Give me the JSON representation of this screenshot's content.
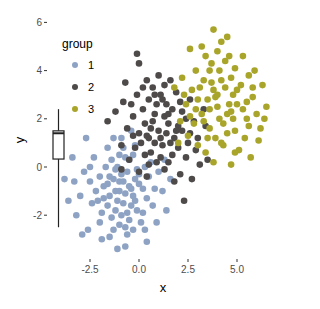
{
  "chart_data": {
    "type": "scatter",
    "title": "",
    "xlabel": "x",
    "ylabel": "y",
    "xlim": [
      -4.6,
      6.8
    ],
    "ylim": [
      -3.8,
      6.3
    ],
    "xticks": [
      -2.5,
      0.0,
      2.5,
      5.0
    ],
    "xtick_labels": [
      "-2.5",
      "0.0",
      "2.5",
      "5.0"
    ],
    "yticks": [
      -2,
      0,
      2,
      4,
      6
    ],
    "ytick_labels": [
      "-2",
      "0",
      "2",
      "4",
      "6"
    ],
    "grid": false,
    "legend": {
      "title": "group",
      "placement": "top-left-inside",
      "entries": [
        "1",
        "2",
        "3"
      ]
    },
    "marginal_boxplot": {
      "axis": "y",
      "whisker_low": -2.5,
      "q1": 0.33,
      "median": 1.4,
      "q3": 1.5,
      "whisker_high": 2.4
    },
    "series": [
      {
        "name": "1",
        "color": "#8EA3C4",
        "points": [
          [
            -1.0,
            -1.0
          ],
          [
            -0.5,
            -0.8
          ],
          [
            -1.3,
            -0.5
          ],
          [
            -0.8,
            -1.5
          ],
          [
            -1.5,
            -1.2
          ],
          [
            -0.2,
            -0.5
          ],
          [
            -1.1,
            0.0
          ],
          [
            -0.6,
            -0.2
          ],
          [
            -1.8,
            -0.8
          ],
          [
            -0.3,
            -1.2
          ],
          [
            -1.2,
            -1.8
          ],
          [
            -0.9,
            -2.0
          ],
          [
            -0.4,
            -1.6
          ],
          [
            -1.6,
            -1.6
          ],
          [
            0.2,
            -0.9
          ],
          [
            0.0,
            -0.3
          ],
          [
            -0.7,
            0.4
          ],
          [
            -1.4,
            0.3
          ],
          [
            -2.0,
            -0.4
          ],
          [
            -2.2,
            -1.0
          ],
          [
            -0.1,
            -1.8
          ],
          [
            0.4,
            -1.3
          ],
          [
            -1.9,
            -1.9
          ],
          [
            -1.0,
            -2.4
          ],
          [
            -0.5,
            -2.2
          ],
          [
            0.5,
            -0.4
          ],
          [
            0.8,
            -0.9
          ],
          [
            -0.3,
            0.5
          ],
          [
            -1.7,
            0.0
          ],
          [
            -2.5,
            -0.6
          ],
          [
            -2.4,
            -1.5
          ],
          [
            -1.3,
            -2.6
          ],
          [
            0.1,
            -2.3
          ],
          [
            -0.8,
            0.8
          ],
          [
            -0.2,
            0.9
          ],
          [
            0.6,
            0.2
          ],
          [
            1.0,
            -0.2
          ],
          [
            -2.8,
            -0.2
          ],
          [
            -3.0,
            -1.2
          ],
          [
            -2.0,
            -2.3
          ],
          [
            -0.6,
            -2.8
          ],
          [
            -1.5,
            -2.9
          ],
          [
            0.3,
            -2.6
          ],
          [
            1.2,
            -1.0
          ],
          [
            -0.9,
            1.2
          ],
          [
            -1.6,
            0.8
          ],
          [
            -2.3,
            0.4
          ],
          [
            -3.3,
            -0.6
          ],
          [
            -3.4,
            0.4
          ],
          [
            -3.8,
            -0.5
          ],
          [
            -3.2,
            -2.0
          ],
          [
            -2.6,
            -2.6
          ],
          [
            -0.7,
            -3.3
          ],
          [
            -1.1,
            -3.4
          ],
          [
            0.4,
            -3.1
          ],
          [
            1.4,
            -1.8
          ],
          [
            1.3,
            0.3
          ],
          [
            -0.4,
            1.5
          ],
          [
            -1.3,
            1.2
          ],
          [
            -2.7,
            1.2
          ],
          [
            -1.0,
            -0.6
          ],
          [
            -0.7,
            -1.1
          ],
          [
            -1.2,
            -1.0
          ],
          [
            -0.4,
            -0.9
          ],
          [
            -0.9,
            -0.3
          ],
          [
            -1.5,
            -0.4
          ],
          [
            -0.6,
            -1.9
          ],
          [
            -1.1,
            -1.4
          ],
          [
            -0.2,
            -1.4
          ],
          [
            -1.8,
            -1.3
          ],
          [
            0.0,
            -0.7
          ],
          [
            -0.8,
            -0.6
          ],
          [
            -1.4,
            -2.1
          ],
          [
            0.7,
            -1.6
          ],
          [
            -2.1,
            -1.4
          ],
          [
            -0.3,
            -2.6
          ],
          [
            -1.0,
            0.5
          ],
          [
            0.3,
            0.0
          ],
          [
            -2.5,
            0.0
          ],
          [
            0.9,
            -2.3
          ],
          [
            -3.6,
            -1.4
          ],
          [
            -2.9,
            -2.8
          ],
          [
            -1.9,
            -3.0
          ],
          [
            1.6,
            -0.5
          ],
          [
            -0.5,
            0.3
          ],
          [
            -1.6,
            -0.7
          ],
          [
            -0.1,
            -0.1
          ],
          [
            -1.2,
            -0.1
          ],
          [
            -0.7,
            -2.5
          ],
          [
            0.2,
            -1.9
          ]
        ]
      },
      {
        "name": "2",
        "color": "#4E4A4A",
        "points": [
          [
            1.0,
            1.5
          ],
          [
            0.5,
            1.2
          ],
          [
            1.5,
            1.8
          ],
          [
            0.8,
            2.2
          ],
          [
            1.2,
            0.9
          ],
          [
            0.3,
            1.8
          ],
          [
            1.8,
            1.2
          ],
          [
            0.6,
            0.6
          ],
          [
            1.4,
            2.6
          ],
          [
            2.0,
            1.7
          ],
          [
            0.0,
            1.4
          ],
          [
            0.2,
            2.4
          ],
          [
            1.1,
            3.0
          ],
          [
            1.7,
            0.5
          ],
          [
            2.2,
            2.3
          ],
          [
            0.9,
            0.2
          ],
          [
            -0.2,
            0.8
          ],
          [
            -0.3,
            2.1
          ],
          [
            0.7,
            3.3
          ],
          [
            2.5,
            1.0
          ],
          [
            1.3,
            -0.1
          ],
          [
            2.4,
            0.4
          ],
          [
            2.8,
            1.9
          ],
          [
            1.9,
            3.1
          ],
          [
            0.4,
            3.6
          ],
          [
            1.0,
            3.8
          ],
          [
            -0.6,
            1.6
          ],
          [
            -0.5,
            0.3
          ],
          [
            2.6,
            2.8
          ],
          [
            3.0,
            1.2
          ],
          [
            2.1,
            -0.3
          ],
          [
            3.1,
            0.1
          ],
          [
            1.6,
            3.6
          ],
          [
            -0.1,
            3.0
          ],
          [
            -0.9,
            0.9
          ],
          [
            -0.8,
            2.7
          ],
          [
            0.0,
            4.3
          ],
          [
            -0.1,
            4.7
          ],
          [
            0.4,
            -0.4
          ],
          [
            3.3,
            2.4
          ],
          [
            2.7,
            -0.5
          ],
          [
            2.3,
            -1.4
          ],
          [
            -1.2,
            2.3
          ],
          [
            1.5,
            0.2
          ],
          [
            0.8,
            1.0
          ],
          [
            1.3,
            2.1
          ],
          [
            0.5,
            2.8
          ],
          [
            2.0,
            0.8
          ],
          [
            1.7,
            2.4
          ],
          [
            0.1,
            1.0
          ],
          [
            1.1,
            1.2
          ],
          [
            0.6,
            1.6
          ],
          [
            1.9,
            1.5
          ],
          [
            0.9,
            2.6
          ],
          [
            1.4,
            1.4
          ],
          [
            0.3,
            0.5
          ],
          [
            2.2,
            1.5
          ],
          [
            1.2,
            2.8
          ],
          [
            0.7,
            1.9
          ],
          [
            1.6,
            1.0
          ],
          [
            -0.4,
            2.6
          ],
          [
            -0.7,
            3.5
          ],
          [
            0.2,
            3.3
          ],
          [
            2.9,
            0.7
          ],
          [
            3.4,
            1.7
          ],
          [
            0.0,
            -0.2
          ],
          [
            -0.9,
            -0.1
          ],
          [
            1.8,
            -0.6
          ],
          [
            -1.6,
            1.9
          ],
          [
            3.5,
            0.3
          ],
          [
            1.1,
            0.4
          ],
          [
            0.4,
            1.3
          ],
          [
            2.4,
            2.0
          ],
          [
            1.3,
            3.4
          ],
          [
            0.8,
            3.0
          ],
          [
            -0.3,
            1.3
          ],
          [
            2.6,
            1.4
          ],
          [
            1.5,
            2.2
          ],
          [
            0.5,
            0.1
          ],
          [
            2.1,
            2.7
          ]
        ]
      },
      {
        "name": "3",
        "color": "#A8A52A",
        "points": [
          [
            4.0,
            2.5
          ],
          [
            3.5,
            2.8
          ],
          [
            4.5,
            2.2
          ],
          [
            3.8,
            3.2
          ],
          [
            4.3,
            1.8
          ],
          [
            3.2,
            2.2
          ],
          [
            4.8,
            3.0
          ],
          [
            3.6,
            1.6
          ],
          [
            4.2,
            3.6
          ],
          [
            5.0,
            2.6
          ],
          [
            3.0,
            2.8
          ],
          [
            3.3,
            3.6
          ],
          [
            4.1,
            4.0
          ],
          [
            4.9,
            1.5
          ],
          [
            5.2,
            3.4
          ],
          [
            3.9,
            1.2
          ],
          [
            2.8,
            1.8
          ],
          [
            2.7,
            3.2
          ],
          [
            3.7,
            4.3
          ],
          [
            5.5,
            2.0
          ],
          [
            4.3,
            0.9
          ],
          [
            5.4,
            1.2
          ],
          [
            5.8,
            2.9
          ],
          [
            4.9,
            4.1
          ],
          [
            3.4,
            4.6
          ],
          [
            4.0,
            4.8
          ],
          [
            2.4,
            2.6
          ],
          [
            2.5,
            1.3
          ],
          [
            5.6,
            3.8
          ],
          [
            6.0,
            2.2
          ],
          [
            5.1,
            0.7
          ],
          [
            6.1,
            1.1
          ],
          [
            4.6,
            4.6
          ],
          [
            2.9,
            4.0
          ],
          [
            2.1,
            1.9
          ],
          [
            2.2,
            3.7
          ],
          [
            3.8,
            5.7
          ],
          [
            4.5,
            5.4
          ],
          [
            3.4,
            0.6
          ],
          [
            6.3,
            3.4
          ],
          [
            5.7,
            0.4
          ],
          [
            4.7,
            0.1
          ],
          [
            1.8,
            3.3
          ],
          [
            2.0,
            1.0
          ],
          [
            6.5,
            2.5
          ],
          [
            5.9,
            4.0
          ],
          [
            2.6,
            4.9
          ],
          [
            3.2,
            5.0
          ],
          [
            4.2,
            5.2
          ],
          [
            5.3,
            4.6
          ],
          [
            4.1,
            2.0
          ],
          [
            3.6,
            2.4
          ],
          [
            4.6,
            2.6
          ],
          [
            3.9,
            2.9
          ],
          [
            4.4,
            3.3
          ],
          [
            3.3,
            1.9
          ],
          [
            4.7,
            2.3
          ],
          [
            3.7,
            3.5
          ],
          [
            4.0,
            3.0
          ],
          [
            4.5,
            1.4
          ],
          [
            5.0,
            3.2
          ],
          [
            3.1,
            3.3
          ],
          [
            4.8,
            2.0
          ],
          [
            3.5,
            1.2
          ],
          [
            5.3,
            2.4
          ],
          [
            2.9,
            2.4
          ],
          [
            4.4,
            4.4
          ],
          [
            5.6,
            1.7
          ],
          [
            3.0,
            0.9
          ],
          [
            5.8,
            3.3
          ],
          [
            2.3,
            3.0
          ],
          [
            6.2,
            1.6
          ],
          [
            4.9,
            0.6
          ],
          [
            3.6,
            4.0
          ],
          [
            5.5,
            2.7
          ],
          [
            4.2,
            1.0
          ],
          [
            2.6,
            2.1
          ],
          [
            4.7,
            3.7
          ],
          [
            3.8,
            0.2
          ],
          [
            6.4,
            2.0
          ]
        ]
      }
    ]
  }
}
